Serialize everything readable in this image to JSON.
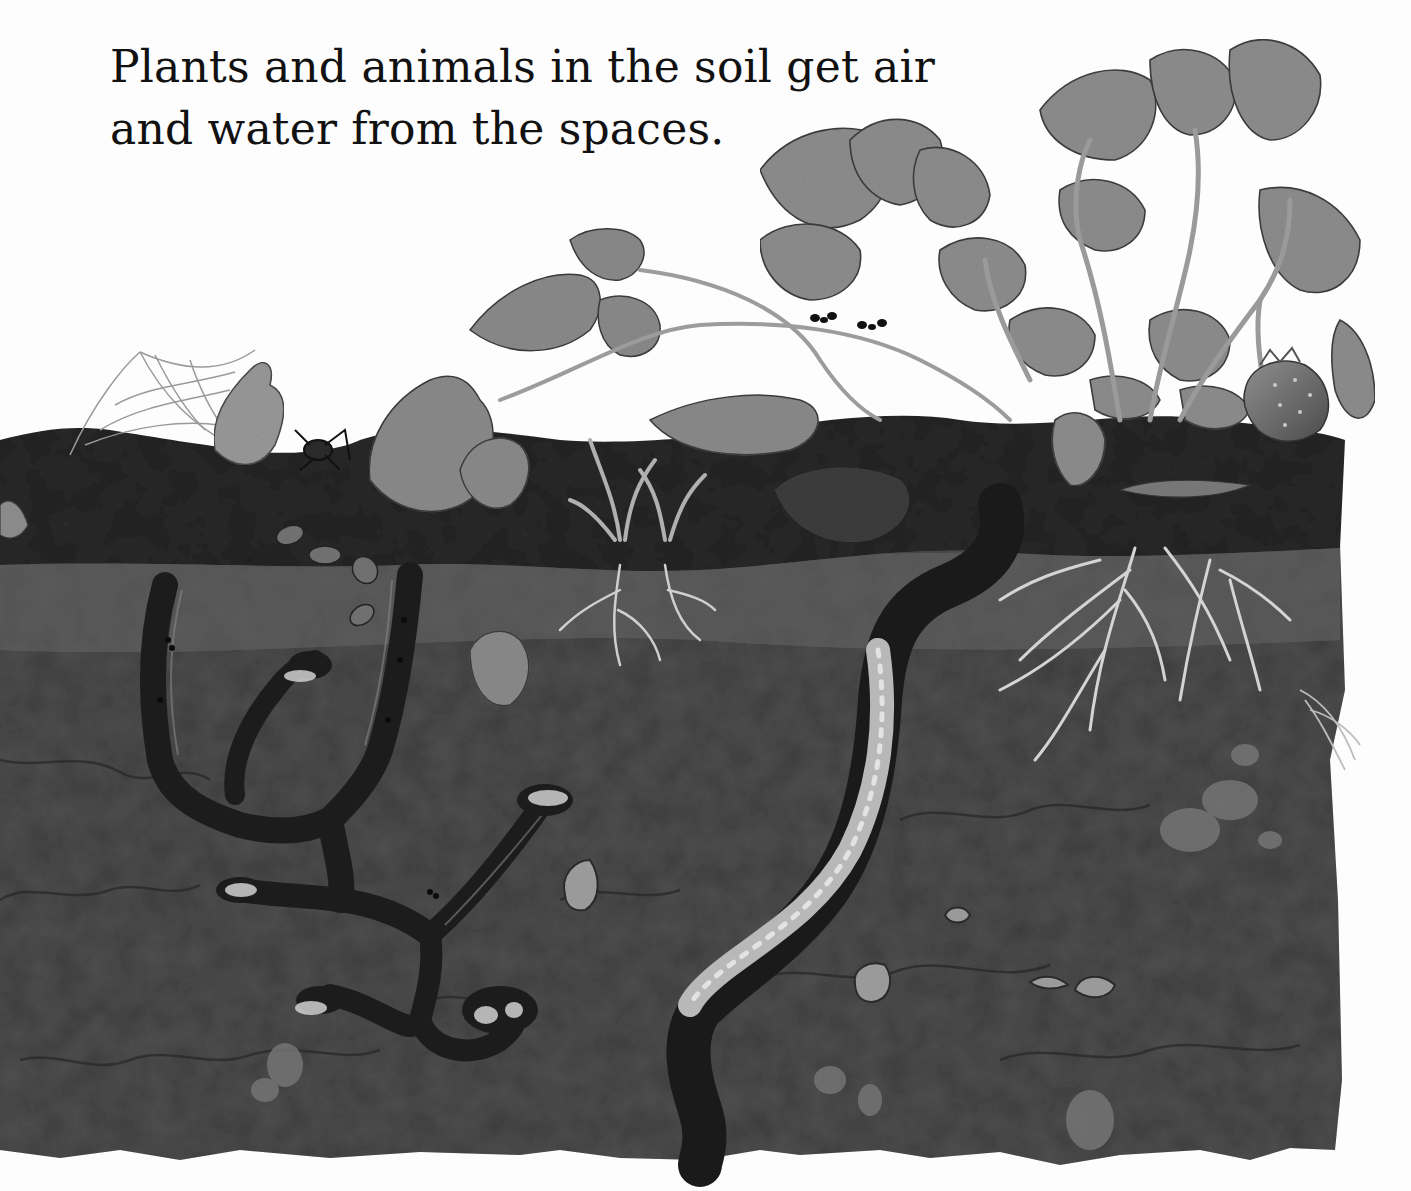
{
  "page": {
    "caption_lines": [
      "Plants and animals in the soil get air",
      "and water from the spaces."
    ]
  },
  "illustration": {
    "subject": "Cross-section of soil showing topsoil and subsoil",
    "elements": [
      "spider-web",
      "spider",
      "pill-bugs",
      "ant-tunnels",
      "ant-egg-chambers",
      "grass-sprouts-with-roots",
      "ants-on-runner-stem",
      "strawberry-plant",
      "strawberry-fruit",
      "strawberry-roots",
      "earthworm-in-burrow",
      "snail-shells",
      "pebbles"
    ],
    "colors": {
      "topsoil": "#2a2a2a",
      "subsoil": "#4d4d4d",
      "burrow": "#1c1c1c",
      "leaf": "#8a8a8a",
      "root": "#cfcfcf",
      "worm": "#bdbdbd",
      "background": "#fdfdfd"
    }
  }
}
